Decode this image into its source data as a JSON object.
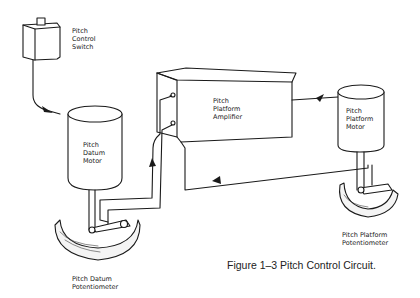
{
  "diagram": {
    "components": [
      {
        "id": "switch",
        "lines": [
          "Pitch",
          "Control",
          "Switch"
        ]
      },
      {
        "id": "datum_motor",
        "lines": [
          "Pitch",
          "Datum",
          "Motor"
        ]
      },
      {
        "id": "amplifier",
        "lines": [
          "Pitch",
          "Platform",
          "Amplifier"
        ]
      },
      {
        "id": "platform_motor",
        "lines": [
          "Pitch",
          "Platform",
          "Motor"
        ]
      },
      {
        "id": "datum_pot",
        "lines": [
          "Pitch Datum",
          "Potentiometer"
        ]
      },
      {
        "id": "platform_pot",
        "lines": [
          "Pitch Platform",
          "Potentiometer"
        ]
      }
    ],
    "caption": "Figure 1–3 Pitch Control Circuit.",
    "colors": {
      "ink": "#1a1a1a",
      "background": "#ffffff"
    }
  }
}
